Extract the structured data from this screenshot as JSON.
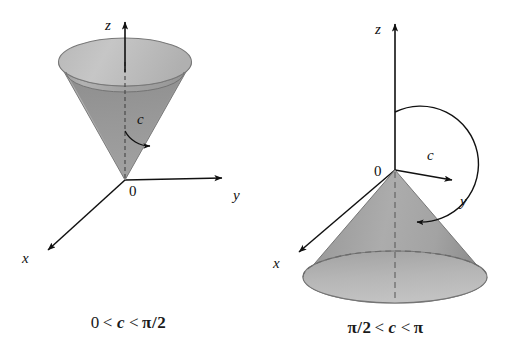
{
  "figure": {
    "kind": "math-diagram",
    "background_color": "#ffffff",
    "ink_color": "#111111",
    "panels": [
      {
        "id": "left",
        "name": "cone-opening-upward",
        "caption": {
          "lower_bound": "0",
          "rel_left": "<",
          "variable": "c",
          "rel_right": "<",
          "upper_bound": "π/2",
          "full_text": "0 < c < π/2"
        },
        "axes": {
          "z_label": "z",
          "y_label": "y",
          "x_label": "x",
          "origin_label": "0"
        },
        "angle": {
          "label": "c",
          "description": "angle from positive z-axis to cone surface"
        },
        "surface": {
          "orientation": "opens upward",
          "outer_fill": "#a9a9a9",
          "inner_fill": "#8e8e8e",
          "rim_fill": "#bdbdbd",
          "edge_color": "#6f6f6f"
        }
      },
      {
        "id": "right",
        "name": "cone-opening-downward",
        "caption": {
          "lower_bound": "π/2",
          "rel_left": "<",
          "variable": "c",
          "rel_right": "<",
          "upper_bound": "π",
          "full_text": "π/2 < c < π"
        },
        "axes": {
          "z_label": "z",
          "y_label": "y",
          "x_label": "x",
          "origin_label": "0"
        },
        "angle": {
          "label": "c",
          "description": "obtuse angle from positive z-axis sweeping down to cone surface"
        },
        "surface": {
          "orientation": "opens downward",
          "outer_fill": "#a3a3a3",
          "inner_fill": "#8c8c8c",
          "base_fill": "#b4b4b4",
          "edge_color": "#6f6f6f"
        }
      }
    ]
  }
}
